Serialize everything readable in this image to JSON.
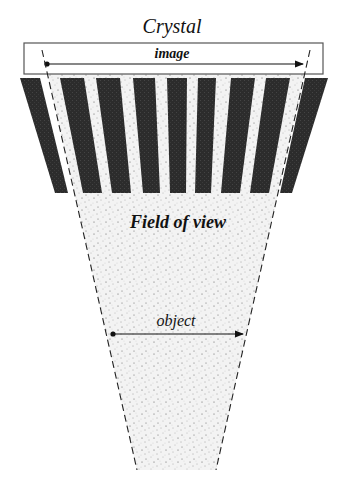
{
  "diagram": {
    "title": "Crystal",
    "image_label": "image",
    "fov_label": "Field of view",
    "object_label": "object",
    "colors": {
      "septa": "#2a2a2a",
      "stipple_bg": "#f2f2f2",
      "stroke": "#222222",
      "crystal_border": "#555555"
    },
    "septa_count": 10
  }
}
